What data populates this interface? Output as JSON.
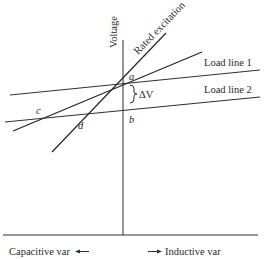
{
  "diagram": {
    "y_axis_label": "Voltage",
    "x_axis_left_label": "Capacitive var",
    "x_axis_right_label": "Inductive var",
    "lines": {
      "rated_excitation": "Rated excitation",
      "load_line_1": "Load line 1",
      "load_line_2": "Load line 2"
    },
    "points": {
      "a": "a",
      "b": "b",
      "c": "c",
      "d": "d"
    },
    "delta_v_label": "ΔV",
    "arrow_left": "←",
    "arrow_right": "→"
  }
}
